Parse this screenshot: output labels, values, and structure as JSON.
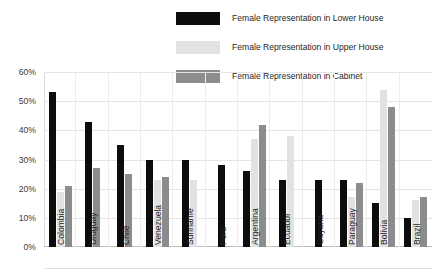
{
  "legend": {
    "position": "top-right",
    "items": [
      {
        "label": "Female Representation in Lower House",
        "color": "#0d0d0d",
        "key": "lower_house"
      },
      {
        "label": "Female Representation in Upper House",
        "color": "#e2e2e2",
        "key": "upper_house"
      },
      {
        "label": "Female Representation in Cabinet",
        "color": "#8c8c8c",
        "key": "cabinet"
      }
    ]
  },
  "yaxis": {
    "ticks": [
      "60%",
      "50%",
      "40%",
      "30%",
      "20%",
      "10%",
      "0%"
    ],
    "min": 0,
    "max": 60
  },
  "chart_data": {
    "type": "bar",
    "title": "",
    "subtitle": "",
    "xlabel": "",
    "ylabel": "",
    "ylim": [
      0,
      60
    ],
    "grid": true,
    "legend_position": "top-right",
    "tick_labels_y": [
      "0%",
      "10%",
      "20%",
      "30%",
      "40%",
      "50%",
      "60%"
    ],
    "categories": [
      "Colombia",
      "Uruguay",
      "Chile",
      "Venezuela",
      "Suriname",
      "Peru",
      "Argentina",
      "Ecuador",
      "Guyana",
      "Paraguay",
      "Bolivia",
      "Brazil"
    ],
    "series": [
      {
        "name": "Female Representation in Lower House",
        "color": "#0d0d0d",
        "values": [
          53,
          43,
          35,
          30,
          30,
          28,
          26,
          23,
          23,
          23,
          15,
          10
        ]
      },
      {
        "name": "Female Representation in Upper House",
        "color": "#e2e2e2",
        "values": [
          19,
          null,
          null,
          23,
          23,
          null,
          37,
          38,
          null,
          17,
          54,
          16
        ]
      },
      {
        "name": "Female Representation in Cabinet",
        "color": "#8c8c8c",
        "values": [
          21,
          27,
          25,
          24,
          null,
          null,
          42,
          null,
          null,
          22,
          48,
          17
        ]
      }
    ]
  }
}
